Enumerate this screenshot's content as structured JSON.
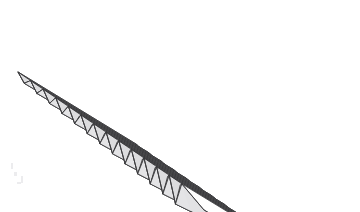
{
  "figure": {
    "background_color": "#ffffff",
    "line_color": "#3a3a3c",
    "shade_color": "#dcdcde",
    "pleat_count": 14,
    "view": "three-quarter view from above-left",
    "right_edge_style": "rounded arc cut",
    "left_edge_style": "zigzag cross-section"
  },
  "geometry": {
    "canvas": {
      "width": 360,
      "height": 212
    },
    "ridge_axis_direction": {
      "dx": 118,
      "dy": 72
    },
    "pleat_step": {
      "dx": 12.6,
      "dy": 8.6
    },
    "ridge_start": {
      "x": 18,
      "y": 72
    },
    "back_start": {
      "x": 136,
      "y": 12
    },
    "valley_drop_near": 26,
    "valley_drop_far": 7,
    "arc_bulge": 7
  },
  "artifacts": [
    {
      "x": 11,
      "y": 163,
      "w": 2,
      "h": 6
    },
    {
      "x": 14,
      "y": 172,
      "w": 3,
      "h": 4
    },
    {
      "x": 21,
      "y": 176,
      "w": 2,
      "h": 7
    },
    {
      "x": 17,
      "y": 182,
      "w": 4,
      "h": 2
    }
  ]
}
